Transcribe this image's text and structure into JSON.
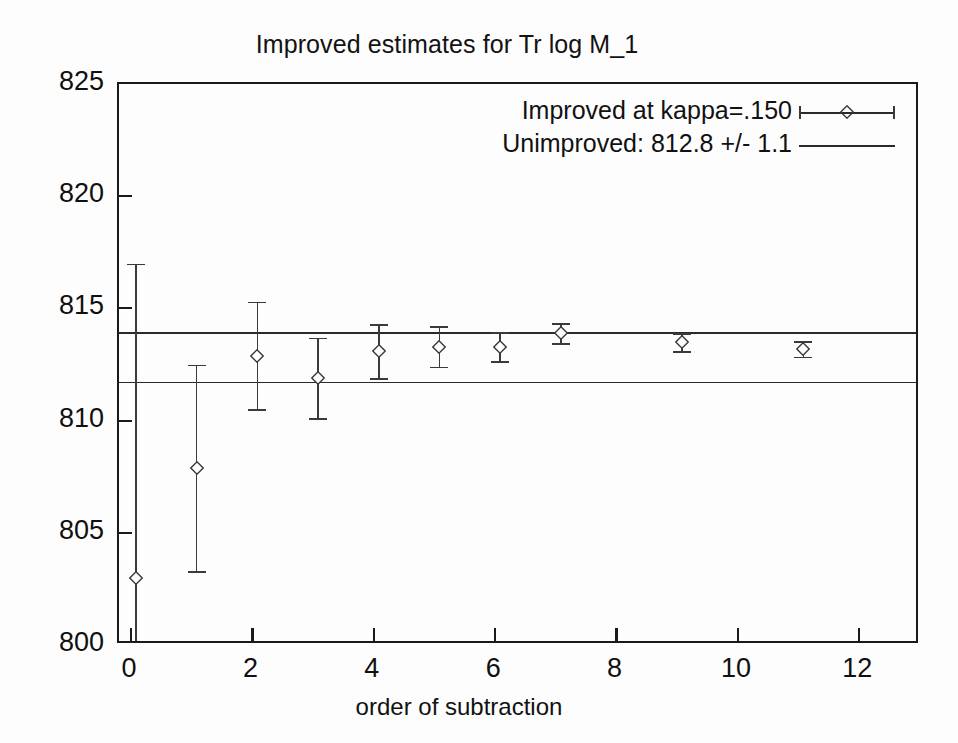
{
  "chart_data": {
    "type": "scatter",
    "title": "Improved estimates for Tr log M_1",
    "xlabel": "order of subtraction",
    "ylabel": "",
    "xlim": [
      -0.2,
      13.0
    ],
    "ylim": [
      800,
      825
    ],
    "xticks": [
      0,
      2,
      4,
      6,
      8,
      10,
      12
    ],
    "xticklabels": [
      "0",
      "2",
      "4",
      "6",
      "8",
      "10",
      "12"
    ],
    "yticks": [
      800,
      805,
      810,
      815,
      820,
      825
    ],
    "yticklabels": [
      "800",
      "805",
      "810",
      "815",
      "820",
      "825"
    ],
    "grid": false,
    "legend_position": "top-right",
    "series": [
      {
        "name": "Improved at kappa=.150",
        "label": "Improved at kappa=.150",
        "marker": "diamond",
        "style": "errorbars",
        "x": [
          0.08,
          1.08,
          2.08,
          3.08,
          4.08,
          5.08,
          6.08,
          7.08,
          9.08,
          11.08
        ],
        "y": [
          803.0,
          807.9,
          812.9,
          811.9,
          813.1,
          813.3,
          813.3,
          813.9,
          813.5,
          813.2
        ],
        "yerr": [
          14.0,
          4.6,
          2.4,
          1.8,
          1.2,
          0.9,
          0.65,
          0.45,
          0.4,
          0.35
        ]
      },
      {
        "name": "Unimproved: 812.8 +/- 1.1",
        "label": "Unimproved: 812.8 +/- 1.1",
        "style": "band",
        "value": 812.8,
        "error": 1.1,
        "upper": 813.9,
        "lower": 811.7
      }
    ]
  },
  "legend": {
    "entries": [
      {
        "label": "Improved at kappa=.150",
        "sample": "errorbar-diamond"
      },
      {
        "label": "Unimproved: 812.8 +/- 1.1",
        "sample": "solid-line"
      }
    ]
  },
  "colors": {
    "axis": "#1a1a1a",
    "data": "#3a3a3a",
    "band": "#2a2a2a",
    "background": "#fdfdfd",
    "text": "#111111"
  }
}
